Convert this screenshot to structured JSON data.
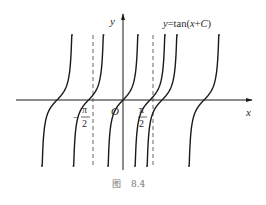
{
  "figure": {
    "caption_prefix": "图",
    "caption_number": "8.4",
    "equation_label": {
      "y": "y",
      "eq": "=tan(",
      "x": "x",
      "plus": "+",
      "c": "C",
      "close": ")"
    },
    "axis_labels": {
      "x": "x",
      "y": "y",
      "origin": "O"
    },
    "tick_labels": {
      "neg_half_pi": {
        "sign": "−",
        "numerator": "π",
        "denominator": "2"
      },
      "pos_half_pi": {
        "numerator": "π",
        "denominator": "2"
      }
    },
    "asymptotes": [
      "-π/2",
      "π/2"
    ],
    "curve_shifts_in_half_pi_units": [
      -2.2,
      -1.15,
      0,
      0.9,
      1.3,
      2.7
    ],
    "colors": {
      "curve": "#1a1a1a",
      "axis": "#1a1a1a",
      "dash": "#555555"
    }
  }
}
